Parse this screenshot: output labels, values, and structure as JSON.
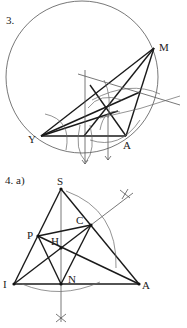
{
  "figure3": {
    "number_label": "3.",
    "points": {
      "M": {
        "label": "M",
        "x": 154,
        "y": 48
      },
      "Y": {
        "label": "Y",
        "x": 41,
        "y": 136
      },
      "A": {
        "label": "A",
        "x": 126,
        "y": 136
      }
    },
    "circle": {
      "cx": 82,
      "cy": 77,
      "r": 76
    }
  },
  "figure4": {
    "number_label": "4.  a)",
    "points": {
      "S": {
        "label": "S",
        "x": 61,
        "y": 189
      },
      "I": {
        "label": "I",
        "x": 14,
        "y": 284
      },
      "A": {
        "label": "A",
        "x": 139,
        "y": 284
      },
      "N": {
        "label": "N",
        "x": 61,
        "y": 284
      },
      "P": {
        "label": "P",
        "x": 38,
        "y": 236
      },
      "C": {
        "label": "C",
        "x": 91,
        "y": 225
      },
      "H": {
        "label": "H",
        "x": 61,
        "y": 248
      }
    }
  },
  "colors": {
    "ink": "#1a1a1a",
    "construction": "#666666",
    "background": "#ffffff"
  }
}
